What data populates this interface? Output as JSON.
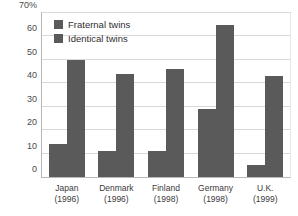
{
  "chart_data": {
    "type": "bar",
    "title": "",
    "xlabel": "",
    "ylabel": "",
    "ylim": [
      0,
      70
    ],
    "grid": true,
    "legend_position": "inside-top-left",
    "categories": [
      "Japan",
      "Denmark",
      "Finland",
      "Germany",
      "U.K."
    ],
    "category_years": [
      "(1996)",
      "(1996)",
      "(1998)",
      "(1998)",
      "(1999)"
    ],
    "category_labels": [
      "Japan (1996)",
      "Denmark (1996)",
      "Finland (1998)",
      "Germany (1998)",
      "U.K. (1999)"
    ],
    "y_ticks": [
      0,
      10,
      20,
      30,
      40,
      50,
      60,
      70
    ],
    "y_tick_labels": [
      "0",
      "10",
      "20",
      "30",
      "40",
      "50",
      "60",
      "70%"
    ],
    "series": [
      {
        "name": "Fraternal twins",
        "values": [
          14,
          11,
          11,
          29,
          5
        ]
      },
      {
        "name": "Identical twins",
        "values": [
          50,
          44,
          46,
          65,
          43
        ]
      }
    ],
    "colors": {
      "bar": "#5a5a5a",
      "gridline": "#d8d8d8",
      "axis": "#b8b8b8",
      "plot_background": "#ffffff",
      "text": "#3a3a3a"
    }
  },
  "legend": {
    "items": [
      {
        "label": "Fraternal twins",
        "color": "#5a5a5a"
      },
      {
        "label": "Identical twins",
        "color": "#5a5a5a"
      }
    ]
  }
}
